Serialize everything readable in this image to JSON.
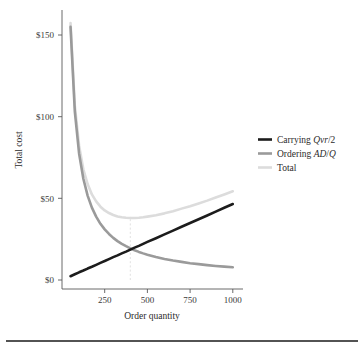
{
  "chart_data": {
    "type": "line",
    "title": "",
    "xlabel": "Order quantity",
    "ylabel": "Total cost",
    "xlim": [
      0,
      1060
    ],
    "ylim": [
      0,
      160
    ],
    "grid": false,
    "legend_position": "right",
    "x_ticks": [
      250,
      500,
      750,
      1000
    ],
    "x_tick_labels": [
      "250",
      "500",
      "750",
      "1000"
    ],
    "y_ticks": [
      0,
      50,
      100,
      150
    ],
    "y_tick_labels": [
      "$0",
      "$50",
      "$100",
      "$150"
    ],
    "annotations": [
      {
        "name": "eoq-guide",
        "type": "vline",
        "x": 400,
        "y_from": 0,
        "y_to": 38.6,
        "style": "dashed",
        "color": "#d9d9d9"
      }
    ],
    "parameters": {
      "carrying_slope_vr_over_2": 0.0465,
      "ordering_AD": 7750,
      "eoq_quantity": 400,
      "minimum_total_cost": 38.6
    },
    "x": [
      50,
      75,
      100,
      125,
      150,
      175,
      200,
      225,
      250,
      275,
      300,
      325,
      350,
      375,
      400,
      425,
      450,
      475,
      500,
      550,
      600,
      650,
      700,
      750,
      800,
      850,
      900,
      950,
      1000
    ],
    "series": [
      {
        "name": "Carrying Qvr/2",
        "legend_label": "Carrying Qvr/2",
        "color": "#1c1c1c",
        "width": 2.6,
        "values": [
          2.3,
          3.5,
          4.7,
          5.8,
          7.0,
          8.1,
          9.3,
          10.5,
          11.6,
          12.8,
          14.0,
          15.1,
          16.3,
          17.4,
          18.6,
          19.8,
          20.9,
          22.1,
          23.3,
          25.6,
          27.9,
          30.2,
          32.6,
          34.9,
          37.2,
          39.5,
          41.9,
          44.2,
          46.5
        ]
      },
      {
        "name": "Ordering AD/Q",
        "legend_label": "Ordering AD/Q",
        "color": "#9a9a9a",
        "width": 2.6,
        "values": [
          155.0,
          103.3,
          77.5,
          62.0,
          51.7,
          44.3,
          38.8,
          34.4,
          31.0,
          28.2,
          25.8,
          23.8,
          22.1,
          20.7,
          19.4,
          18.2,
          17.2,
          16.3,
          15.5,
          14.1,
          12.9,
          11.9,
          11.1,
          10.3,
          9.7,
          9.1,
          8.6,
          8.2,
          7.8
        ]
      },
      {
        "name": "Total",
        "legend_label": "Total",
        "color": "#dcdcdc",
        "width": 2.6,
        "values": [
          157.3,
          106.8,
          82.2,
          67.8,
          58.7,
          52.4,
          48.1,
          44.9,
          42.6,
          41.0,
          39.8,
          38.9,
          38.4,
          38.1,
          38.0,
          38.0,
          38.1,
          38.4,
          38.8,
          39.7,
          40.8,
          42.1,
          43.7,
          45.2,
          46.9,
          48.6,
          50.5,
          52.4,
          54.3
        ]
      }
    ]
  },
  "legend": {
    "items": [
      {
        "label_plain": "Carrying Qvr/2",
        "prefix": "Carrying ",
        "mathvar": "Qvr",
        "suffix": "/2",
        "color": "#1c1c1c"
      },
      {
        "label_plain": "Ordering AD/Q",
        "prefix": "Ordering ",
        "mathvar": "AD",
        "mid": "/",
        "mathvar2": "Q",
        "suffix": "",
        "color": "#9a9a9a"
      },
      {
        "label_plain": "Total",
        "prefix": "Total",
        "mathvar": "",
        "suffix": "",
        "color": "#dcdcdc"
      }
    ]
  },
  "colors": {
    "carrying": "#1c1c1c",
    "ordering": "#9a9a9a",
    "total": "#dcdcdc",
    "axis": "#5a5a5a",
    "text": "#2b2b2b",
    "guide": "#d9d9d9",
    "footer_rule": "#1a1a1a",
    "background": "#ffffff"
  }
}
